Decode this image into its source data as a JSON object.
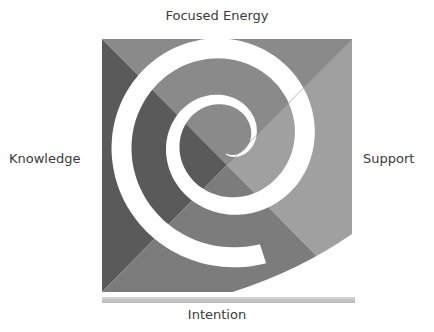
{
  "diagram": {
    "type": "spiral-quadrant",
    "labels": {
      "top": "Focused Energy",
      "left": "Knowledge",
      "right": "Support",
      "bottom": "Intention"
    },
    "colors": {
      "top": "#8a8a8a",
      "left": "#5a5a5a",
      "right": "#a0a0a0",
      "bottom": "#7c7c7c",
      "spiral": "#ffffff",
      "base_bar": "#c8c8c8"
    }
  }
}
